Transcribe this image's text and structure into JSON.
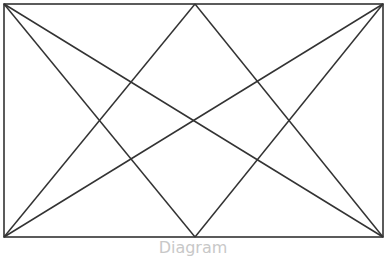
{
  "diagram": {
    "stroke_color": "#333333",
    "frame": {
      "x": 4,
      "y": 4,
      "width": 379,
      "height": 233
    },
    "lines": [
      {
        "name": "diagonal-top-left-to-bottom-right",
        "x1": 4,
        "y1": 4,
        "x2": 383,
        "y2": 237
      },
      {
        "name": "diagonal-top-right-to-bottom-left",
        "x1": 383,
        "y1": 4,
        "x2": 4,
        "y2": 237
      },
      {
        "name": "top-left-to-bottom-mid",
        "x1": 4,
        "y1": 4,
        "x2": 195,
        "y2": 237
      },
      {
        "name": "top-right-to-bottom-mid",
        "x1": 383,
        "y1": 4,
        "x2": 195,
        "y2": 237
      },
      {
        "name": "top-mid-to-bottom-left",
        "x1": 195,
        "y1": 4,
        "x2": 4,
        "y2": 237
      },
      {
        "name": "top-mid-to-bottom-right",
        "x1": 195,
        "y1": 4,
        "x2": 383,
        "y2": 237
      }
    ],
    "caption": "Diagram"
  }
}
